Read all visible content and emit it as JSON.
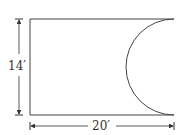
{
  "diagram": {
    "height_label": "14′",
    "width_label": "20′",
    "colors": {
      "stroke": "#444444",
      "background": "#ffffff"
    }
  }
}
